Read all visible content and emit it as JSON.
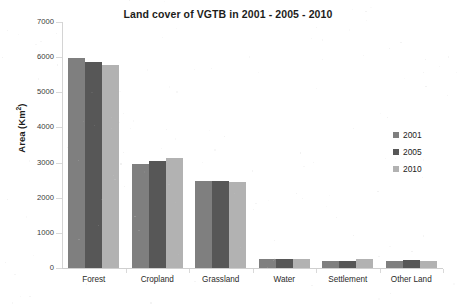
{
  "chart_data": {
    "type": "bar",
    "title": "Land cover of VGTB in 2001 - 2005 - 2010",
    "xlabel": "",
    "ylabel": "Area (Km²)",
    "ylabel_base": "Area (Km",
    "ylabel_exponent": "2",
    "ylabel_close": ")",
    "ylim": [
      0,
      7000
    ],
    "ytick_step": 1000,
    "ytick_labels": [
      "7000",
      "6000",
      "5000",
      "4000",
      "3000",
      "2000",
      "1000",
      "0"
    ],
    "ytick_values": [
      7000,
      6000,
      5000,
      4000,
      3000,
      2000,
      1000,
      0
    ],
    "grid": false,
    "legend_position": "right",
    "categories": [
      "Forest",
      "Cropland",
      "Grassland",
      "Water",
      "Settlement",
      "Other Land"
    ],
    "series": [
      {
        "name": "2001",
        "color": "#7f7f7f",
        "values": [
          5980,
          2950,
          2470,
          250,
          200,
          200
        ]
      },
      {
        "name": "2005",
        "color": "#575757",
        "values": [
          5860,
          3040,
          2470,
          250,
          210,
          215
        ]
      },
      {
        "name": "2010",
        "color": "#b2b2b2",
        "values": [
          5790,
          3120,
          2440,
          250,
          245,
          190
        ]
      }
    ]
  },
  "legend": {
    "entries": [
      {
        "label": "2001"
      },
      {
        "label": "2005"
      },
      {
        "label": "2010"
      }
    ]
  }
}
